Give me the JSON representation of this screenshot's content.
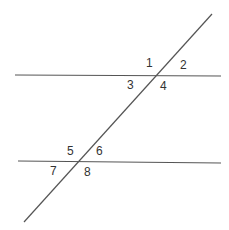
{
  "diagram": {
    "colors": {
      "line": "#555555",
      "label": "#333333",
      "background": "#ffffff"
    },
    "lines": {
      "top_parallel": {
        "x1": 15,
        "y1": 75,
        "x2": 221,
        "y2": 76
      },
      "bottom_parallel": {
        "x1": 18,
        "y1": 161,
        "x2": 221,
        "y2": 163
      },
      "transversal": {
        "x1": 212,
        "y1": 14,
        "x2": 24,
        "y2": 222
      }
    },
    "angle_labels": [
      {
        "id": "1",
        "text": "1",
        "x": 146,
        "y": 67
      },
      {
        "id": "2",
        "text": "2",
        "x": 180,
        "y": 69
      },
      {
        "id": "3",
        "text": "3",
        "x": 127,
        "y": 89
      },
      {
        "id": "4",
        "text": "4",
        "x": 160,
        "y": 90
      },
      {
        "id": "5",
        "text": "5",
        "x": 67,
        "y": 155
      },
      {
        "id": "6",
        "text": "6",
        "x": 96,
        "y": 155
      },
      {
        "id": "7",
        "text": "7",
        "x": 50,
        "y": 175
      },
      {
        "id": "8",
        "text": "8",
        "x": 84,
        "y": 176
      }
    ]
  }
}
